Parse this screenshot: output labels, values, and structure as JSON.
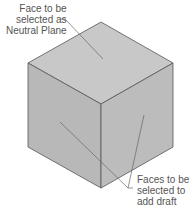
{
  "diagram": {
    "labels": {
      "neutral_plane": [
        "Face to be",
        "selected as",
        "Neutral Plane"
      ],
      "draft_faces": [
        "Faces to be",
        "selected to",
        "add draft"
      ]
    },
    "colors": {
      "top_face": "#c8c8c8",
      "left_face": "#b8b8b8",
      "right_face": "#bcbcbc",
      "edge": "#555555",
      "text": "#555555"
    }
  }
}
